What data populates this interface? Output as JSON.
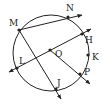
{
  "diagram": {
    "type": "circle-geometry",
    "circle": {
      "center_label": "O",
      "cx": 51,
      "cy": 53,
      "r": 38
    },
    "colors": {
      "stroke": "#222222",
      "background": "#ffffff"
    },
    "points": [
      {
        "id": "M",
        "label": "M",
        "x": 19,
        "y": 30,
        "lx": 9,
        "ly": 26
      },
      {
        "id": "N",
        "label": "N",
        "x": 68,
        "y": 17,
        "lx": 66,
        "ly": 11
      },
      {
        "id": "H",
        "label": "H",
        "x": 82,
        "y": 34,
        "lx": 85,
        "ly": 43
      },
      {
        "id": "K",
        "label": "K",
        "x": 88,
        "y": 55,
        "lx": 92,
        "ly": 60
      },
      {
        "id": "P",
        "label": "P",
        "x": 80,
        "y": 74,
        "lx": 84,
        "ly": 75
      },
      {
        "id": "J",
        "label": "J",
        "x": 56,
        "y": 89,
        "lx": 57,
        "ly": 86
      },
      {
        "id": "L",
        "label": "L",
        "x": 17,
        "y": 68,
        "lx": 19,
        "ly": 64
      },
      {
        "id": "O",
        "label": "O",
        "x": 50,
        "y": 50,
        "lx": 55,
        "ly": 57
      }
    ],
    "rays": [
      {
        "name": "ray-MN",
        "from": "M",
        "x1": 19,
        "y1": 30,
        "x2": 82,
        "y2": 15
      },
      {
        "name": "line-LH",
        "from": "L",
        "x1": 9,
        "y1": 72,
        "x2": 91,
        "y2": 29,
        "double_arrow": true
      },
      {
        "name": "ray-OP",
        "from": "O",
        "x1": 50,
        "y1": 50,
        "x2": 90,
        "y2": 84
      },
      {
        "name": "ray-MJ",
        "from": "M",
        "x1": 19,
        "y1": 30,
        "x2": 61,
        "y2": 99
      }
    ]
  }
}
